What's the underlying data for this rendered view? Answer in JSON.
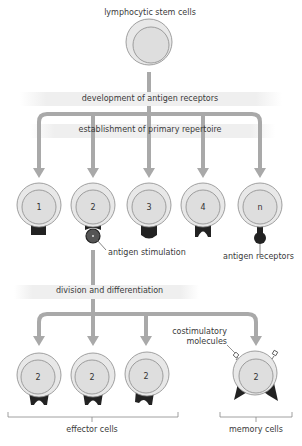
{
  "diagram": {
    "title": "lymphocytic stem cells",
    "stages": {
      "development": "development of antigen receptors",
      "establishment": "establishment of primary repertoire",
      "division": "division and differentiation"
    },
    "repertoire_cells": [
      {
        "label": "1",
        "receptor": "square"
      },
      {
        "label": "2",
        "receptor": "cup-with-antigen"
      },
      {
        "label": "3",
        "receptor": "rounded-bottom"
      },
      {
        "label": "4",
        "receptor": "notched"
      },
      {
        "label": "n",
        "receptor": "round-knob"
      }
    ],
    "annotations": {
      "antigen_stimulation": "antigen stimulation",
      "antigen_receptors": "antigen receptors",
      "costimulatory": "costimulatory molecules"
    },
    "effector_cells": [
      {
        "label": "2"
      },
      {
        "label": "2"
      },
      {
        "label": "2"
      }
    ],
    "memory_cells": [
      {
        "label": "2"
      }
    ],
    "groups": {
      "effector": "effector cells",
      "memory": "memory cells"
    },
    "colors": {
      "arrow": "#a9a9a9",
      "cell_outer": "#e6e6e6",
      "cell_inner": "#dcdcdc",
      "cell_stroke": "#8a8a8a",
      "receptor": "#222222",
      "band": "#efefef"
    }
  }
}
